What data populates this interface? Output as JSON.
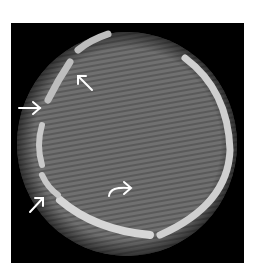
{
  "image": {
    "description": "Axial CT slice of a skull showing fracture lines, annotated with arrows",
    "background_color": "#ffffff",
    "frame_color": "#000000",
    "tissue_color": "#6e6e6e",
    "bone_color": "#d8d8d8",
    "annotation_color": "#ffffff"
  },
  "annotations": [
    {
      "type": "straight-arrow",
      "direction": "right"
    },
    {
      "type": "straight-arrow",
      "direction": "up-left"
    },
    {
      "type": "straight-arrow",
      "direction": "up-right"
    },
    {
      "type": "curved-arrow",
      "direction": "right"
    }
  ]
}
